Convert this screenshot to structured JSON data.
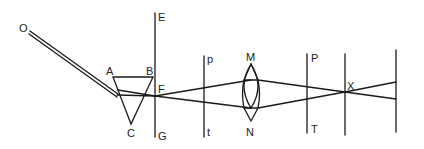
{
  "diagram": {
    "type": "optics-ray-diagram",
    "stroke_color": "#1a1a1a",
    "background": "#ffffff",
    "labels": {
      "O": "O",
      "A": "A",
      "B": "B",
      "C": "C",
      "E": "E",
      "F": "F",
      "G": "G",
      "p": "p",
      "t": "t",
      "M": "M",
      "N": "N",
      "P": "P",
      "T": "T",
      "X": "X"
    },
    "components": [
      {
        "id": "incident-beam",
        "label": "O",
        "kind": "double-line beam"
      },
      {
        "id": "prism",
        "labels": [
          "A",
          "B",
          "C"
        ],
        "kind": "triangular prism"
      },
      {
        "id": "screen-EG",
        "labels": [
          "E",
          "F",
          "G"
        ],
        "kind": "vertical board"
      },
      {
        "id": "screen-pt",
        "labels": [
          "p",
          "t"
        ],
        "kind": "vertical board"
      },
      {
        "id": "lens",
        "labels": [
          "M",
          "N"
        ],
        "kind": "biconvex lens"
      },
      {
        "id": "screen-PT",
        "labels": [
          "P",
          "T"
        ],
        "kind": "vertical board"
      },
      {
        "id": "focus-line",
        "labels": [
          "X"
        ],
        "kind": "vertical line at crossing point"
      },
      {
        "id": "far-screen",
        "labels": [],
        "kind": "vertical board"
      }
    ]
  }
}
